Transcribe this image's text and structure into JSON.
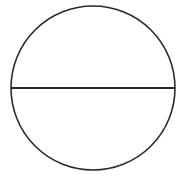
{
  "diagram": {
    "shapes": [
      {
        "kind": "circle",
        "role": "outline"
      },
      {
        "kind": "line",
        "role": "horizontal-diameter"
      }
    ],
    "colors": {
      "stroke": "#2a2a2a",
      "background": "#ffffff"
    }
  }
}
